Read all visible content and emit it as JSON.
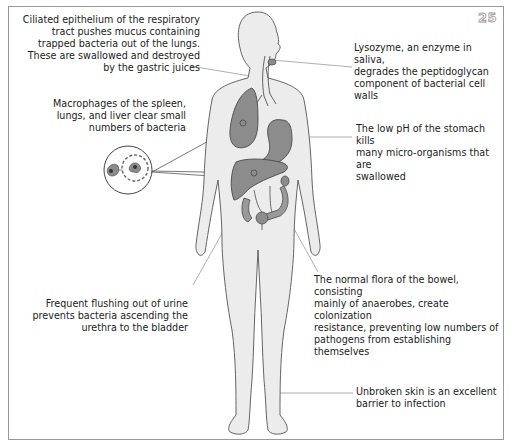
{
  "page_number": "25",
  "colors": {
    "skin_fill": "#eaeaea",
    "outline": "#555555",
    "organ_fill": "#8c8c8c",
    "organ_outline": "#4a4a4a",
    "leader_line": "#9a9a9a",
    "frame": "#9a9a9a"
  },
  "labels": {
    "respiratory": "Ciliated epithelium of the respiratory tract pushes mucus containing trapped bacteria out of the lungs. These are swallowed and destroyed by the gastric juices",
    "respiratory_lines": [
      "Ciliated epithelium of the respiratory",
      "tract pushes mucus containing",
      "trapped bacteria out of the lungs.",
      "These are swallowed and destroyed",
      "by the gastric juices"
    ],
    "lysozyme_lines": [
      "Lysozyme, an enzyme in saliva,",
      "degrades the peptidoglycan",
      "component of bacterial cell walls"
    ],
    "macrophages_lines": [
      "Macrophages of the spleen,",
      "lungs, and liver clear small",
      "numbers of bacteria"
    ],
    "stomach_lines": [
      "The low pH of the stomach kills",
      "many micro-organisms that are",
      "swallowed"
    ],
    "urine_lines": [
      "Frequent flushing out of urine",
      "prevents bacteria ascending the",
      "urethra to the bladder"
    ],
    "bowel_lines": [
      "The normal flora of the bowel, consisting",
      "mainly of anaerobes, create colonization",
      "resistance, preventing low numbers of",
      "pathogens from establishing themselves"
    ],
    "skin_lines": [
      "Unbroken skin is an excellent",
      "barrier to infection"
    ]
  },
  "figure": {
    "organs": [
      "mouth/saliva glands",
      "trachea",
      "lung",
      "stomach",
      "liver",
      "spleen",
      "colon",
      "bladder"
    ],
    "inset": "macrophage engulfing bacterium"
  }
}
